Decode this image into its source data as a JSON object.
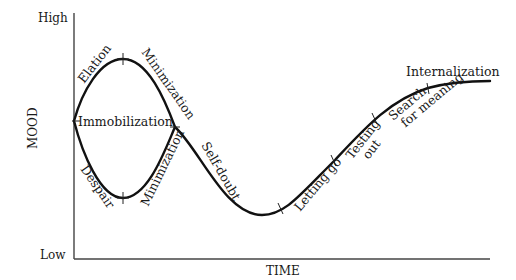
{
  "diagram": {
    "type": "transition-curve",
    "axes": {
      "y_label": "MOOD",
      "y_high": "High",
      "y_low": "Low",
      "x_label": "TIME"
    },
    "stages": {
      "immobilization": "Immobilization",
      "elation": "Elation",
      "minimization_upper": "Minimization",
      "despair": "Despair",
      "minimization_lower": "Minimization",
      "self_doubt": "Self-doubt",
      "letting_go": "Letting go",
      "testing_out_line1": "Testing",
      "testing_out_line2": "out",
      "search_line1": "Search",
      "search_line2": "for meaning",
      "internalization": "Internalization"
    },
    "colors": {
      "curve": "#111111",
      "axis": "#444444",
      "text": "#1a1a1a",
      "background": "#ffffff"
    }
  }
}
